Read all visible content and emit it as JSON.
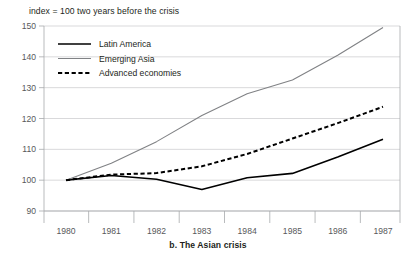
{
  "figure": {
    "axis_note": "index = 100 two years before the crisis",
    "caption": "b. The Asian crisis"
  },
  "legend": {
    "items": [
      {
        "label": "Latin America",
        "style": "solid",
        "color": "#000000"
      },
      {
        "label": "Emerging Asia",
        "style": "solid",
        "color": "#808285"
      },
      {
        "label": "Advanced economies",
        "style": "dashed",
        "color": "#000000"
      }
    ]
  },
  "axes": {
    "y_ticks": [
      "150",
      "140",
      "130",
      "120",
      "110",
      "100",
      "90"
    ],
    "x_ticks": [
      "1980",
      "1981",
      "1982",
      "1983",
      "1984",
      "1985",
      "1986",
      "1987"
    ]
  },
  "chart_data": {
    "type": "line",
    "title": "b. The Asian crisis",
    "subtitle": "index = 100 two years before the crisis",
    "xlabel": "",
    "ylabel": "",
    "ylim": [
      90,
      150
    ],
    "ytick_step": 10,
    "grid": true,
    "legend_position": "top-left",
    "x": [
      1980,
      1981,
      1982,
      1983,
      1984,
      1985,
      1986,
      1987
    ],
    "categories": [
      "1980",
      "1981",
      "1982",
      "1983",
      "1984",
      "1985",
      "1986",
      "1987"
    ],
    "series": [
      {
        "name": "Latin America",
        "color": "#000000",
        "style": "solid",
        "values": [
          100.0,
          101.5,
          100.3,
          97.0,
          100.8,
          102.2,
          107.5,
          113.3
        ]
      },
      {
        "name": "Emerging Asia",
        "color": "#808285",
        "style": "solid",
        "values": [
          100.0,
          105.5,
          112.5,
          121.0,
          128.0,
          132.5,
          140.5,
          149.5
        ]
      },
      {
        "name": "Advanced economies",
        "color": "#000000",
        "style": "dashed",
        "values": [
          100.0,
          101.8,
          102.3,
          104.5,
          108.5,
          113.5,
          118.5,
          123.8
        ]
      }
    ]
  }
}
